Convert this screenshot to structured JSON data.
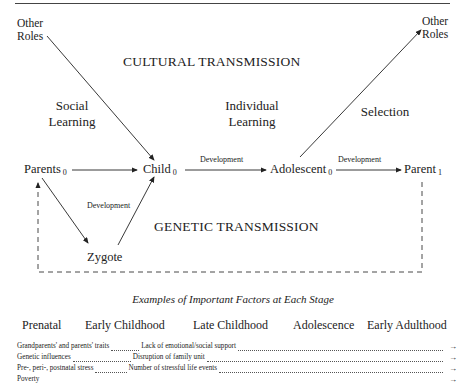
{
  "diagram": {
    "nodes": {
      "other_roles_left": "Other\nRoles",
      "other_roles_right": "Other\nRoles",
      "parents": {
        "label": "Parents",
        "sub": "0"
      },
      "child": {
        "label": "Child",
        "sub": "0"
      },
      "adolescent": {
        "label": "Adolescent",
        "sub": "0"
      },
      "parent1": {
        "label": "Parent",
        "sub": "1"
      },
      "zygote": "Zygote"
    },
    "regions": {
      "cultural": "CULTURAL TRANSMISSION",
      "genetic": "GENETIC TRANSMISSION"
    },
    "process_labels": {
      "social_learning": "Social\nLearning",
      "individual_learning": "Individual\nLearning",
      "selection": "Selection",
      "dev_child_adolescent": "Development",
      "dev_adolescent_parent": "Development",
      "dev_zygote": "Development"
    }
  },
  "factors": {
    "caption": "Examples of Important Factors at Each Stage",
    "stages": [
      "Prenatal",
      "Early Childhood",
      "Late Childhood",
      "Adolescence",
      "Early Adulthood"
    ],
    "rows": [
      {
        "prenatal": "Grandparents' and parents' traits",
        "next": "Lack of emotional/social support"
      },
      {
        "prenatal": "Genetic influences",
        "next": "Disruption of family unit"
      },
      {
        "prenatal": "Pre-, peri-, postnatal stress",
        "next": "Number of stressful life events"
      },
      {
        "prenatal": "Poverty",
        "next": ""
      }
    ],
    "arrow_glyph": "→"
  }
}
